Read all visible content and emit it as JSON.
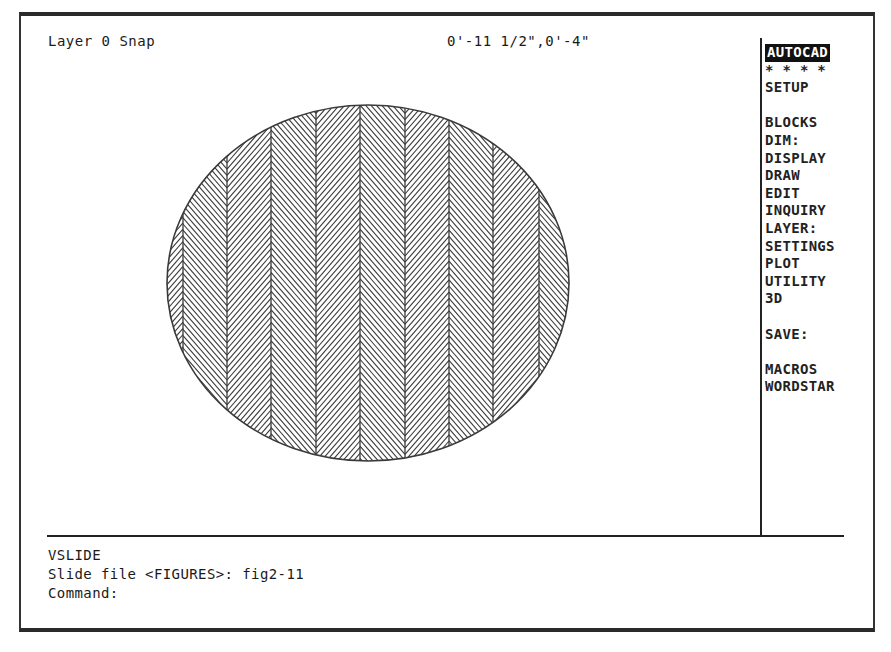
{
  "status_bar": {
    "layer_snap": "Layer 0 Snap",
    "coordinates": "0'-11 1/2\",0'-4\""
  },
  "screen_menu": {
    "items": [
      {
        "label": "AUTOCAD",
        "highlighted": true
      },
      {
        "label": "* * * *"
      },
      {
        "label": "SETUP"
      },
      {
        "label": ""
      },
      {
        "label": "BLOCKS"
      },
      {
        "label": "DIM:"
      },
      {
        "label": "DISPLAY"
      },
      {
        "label": "DRAW"
      },
      {
        "label": "EDIT"
      },
      {
        "label": "INQUIRY"
      },
      {
        "label": "LAYER:"
      },
      {
        "label": "SETTINGS"
      },
      {
        "label": "PLOT"
      },
      {
        "label": "UTILITY"
      },
      {
        "label": "3D"
      },
      {
        "label": ""
      },
      {
        "label": "SAVE:"
      },
      {
        "label": ""
      },
      {
        "label": "MACROS"
      },
      {
        "label": "WORDSTAR"
      }
    ]
  },
  "drawing": {
    "shape": "ellipse",
    "hatch_pattern": "herringbone",
    "cx": 368,
    "cy": 283,
    "rx": 201,
    "ry": 178,
    "column_lines_x": [
      183,
      227,
      271,
      316,
      360,
      405,
      449,
      493,
      539
    ],
    "stroke_color": "#3a3a3a"
  },
  "command_area": {
    "lines": [
      "VSLIDE",
      "Slide file <FIGURES>: fig2-11",
      "Command:"
    ]
  }
}
